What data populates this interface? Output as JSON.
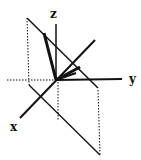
{
  "diagram": {
    "type": "3d-coordinate-axes",
    "axes": {
      "x": {
        "label": "x",
        "from": [
          95,
          40
        ],
        "to": [
          20,
          118
        ],
        "label_pos": [
          10,
          131
        ]
      },
      "y": {
        "label": "y",
        "from": [
          56,
          80
        ],
        "to": [
          122,
          79
        ],
        "label_pos": [
          129,
          83
        ]
      },
      "z": {
        "label": "z",
        "from": [
          56,
          80
        ],
        "to": [
          56,
          24
        ],
        "label_pos": [
          50,
          18
        ]
      }
    },
    "origin": [
      56,
      80
    ],
    "negative_y_dotted": {
      "from": [
        7,
        80
      ],
      "to": [
        56,
        80
      ]
    },
    "negative_z_dotted": {
      "from": [
        58,
        82
      ],
      "to": [
        58,
        120
      ]
    },
    "plane": {
      "top_edge": {
        "from": [
          27,
          18
        ],
        "to": [
          98,
          88
        ]
      },
      "left_dotted": {
        "from": [
          27,
          18
        ],
        "to": [
          29,
          85
        ]
      },
      "bottom_edge": {
        "from": [
          29,
          85
        ],
        "to": [
          100,
          155
        ]
      },
      "right_dotted": {
        "from": [
          98,
          90
        ],
        "to": [
          100,
          155
        ]
      }
    },
    "vectors": [
      {
        "from": [
          56,
          80
        ],
        "to": [
          44,
          33
        ]
      },
      {
        "from": [
          56,
          80
        ],
        "to": [
          80,
          67
        ]
      },
      {
        "from": [
          56,
          80
        ],
        "to": [
          76,
          73
        ]
      }
    ],
    "colors": {
      "line": "#111111",
      "background": "#ffffff"
    }
  }
}
